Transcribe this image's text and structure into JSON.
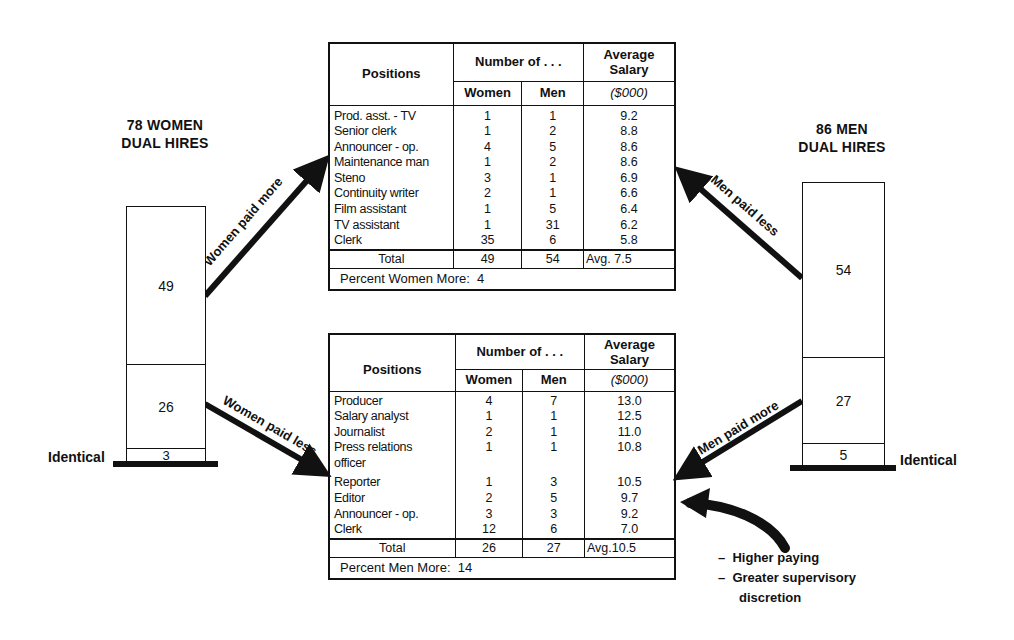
{
  "left_group": {
    "title_line1": "78 WOMEN",
    "title_line2": "DUAL HIRES",
    "segments": [
      {
        "label": "49",
        "meaning": "Women paid more"
      },
      {
        "label": "26",
        "meaning": "Women paid less"
      },
      {
        "label": "3",
        "meaning": "Identical"
      }
    ],
    "identical_label": "Identical",
    "arrow_up_label": "Women paid more",
    "arrow_down_label": "Women paid less"
  },
  "right_group": {
    "title_line1": "86 MEN",
    "title_line2": "DUAL HIRES",
    "segments": [
      {
        "label": "54",
        "meaning": "Men paid less"
      },
      {
        "label": "27",
        "meaning": "Men paid more"
      },
      {
        "label": "5",
        "meaning": "Identical"
      }
    ],
    "identical_label": "Identical",
    "arrow_up_label": "Men paid less",
    "arrow_down_label": "Men paid more"
  },
  "table_headers": {
    "positions": "Positions",
    "number_of": "Number of . . .",
    "avg_salary_line1": "Average",
    "avg_salary_line2": "Salary",
    "women": "Women",
    "men": "Men",
    "unit": "($000)"
  },
  "table_top": {
    "rows": [
      {
        "position": "Prod. asst. - TV",
        "women": "1",
        "men": "1",
        "salary": "9.2"
      },
      {
        "position": "Senior clerk",
        "women": "1",
        "men": "2",
        "salary": "8.8"
      },
      {
        "position": "Announcer - op.",
        "women": "4",
        "men": "5",
        "salary": "8.6"
      },
      {
        "position": "Maintenance man",
        "women": "1",
        "men": "2",
        "salary": "8.6"
      },
      {
        "position": "Steno",
        "women": "3",
        "men": "1",
        "salary": "6.9"
      },
      {
        "position": "Continuity writer",
        "women": "2",
        "men": "1",
        "salary": "6.6"
      },
      {
        "position": "Film assistant",
        "women": "1",
        "men": "5",
        "salary": "6.4"
      },
      {
        "position": "TV assistant",
        "women": "1",
        "men": "31",
        "salary": "6.2"
      },
      {
        "position": "Clerk",
        "women": "35",
        "men": "6",
        "salary": "5.8"
      }
    ],
    "total_label": "Total",
    "total_women": "49",
    "total_men": "54",
    "total_avg": "Avg. 7.5",
    "percent_label": "Percent Women More:  4"
  },
  "table_bottom": {
    "rows": [
      {
        "position": "Producer",
        "women": "4",
        "men": "7",
        "salary": "13.0"
      },
      {
        "position": "Salary analyst",
        "women": "1",
        "men": "1",
        "salary": "12.5"
      },
      {
        "position": "Journalist",
        "women": "2",
        "men": "1",
        "salary": "11.0"
      },
      {
        "position": "Press relations",
        "women": "1",
        "men": "1",
        "salary": "10.8"
      },
      {
        "position": "officer",
        "women": "",
        "men": "",
        "salary": ""
      },
      {
        "position": "Reporter",
        "women": "1",
        "men": "3",
        "salary": "10.5"
      },
      {
        "position": "Editor",
        "women": "2",
        "men": "5",
        "salary": "9.7"
      },
      {
        "position": "Announcer - op.",
        "women": "3",
        "men": "3",
        "salary": "9.2"
      },
      {
        "position": "Clerk",
        "women": "12",
        "men": "6",
        "salary": "7.0"
      }
    ],
    "total_label": "Total",
    "total_women": "26",
    "total_men": "27",
    "total_avg": "Avg.10.5",
    "percent_label": "Percent Men More:  14"
  },
  "annotation": {
    "line1": "–  Higher paying",
    "line2": "–  Greater supervisory",
    "line3": "discretion"
  }
}
